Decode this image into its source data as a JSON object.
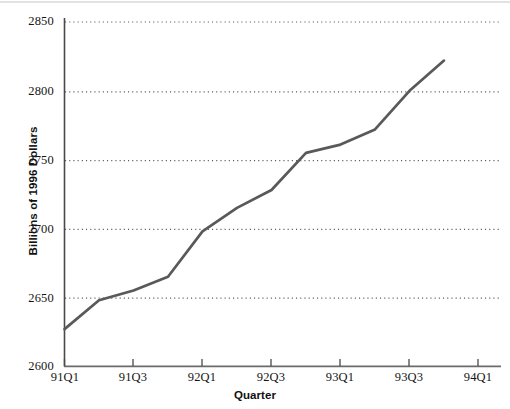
{
  "chart_data": {
    "type": "line",
    "title": "",
    "xlabel": "Quarter",
    "ylabel": "Billions of 1996 Dollars",
    "ylim": [
      2600,
      2850
    ],
    "ytick_labels": [
      "2600",
      "2650",
      "2700",
      "2750",
      "2800",
      "2850"
    ],
    "ytick_values": [
      2600,
      2650,
      2700,
      2750,
      2800,
      2850
    ],
    "xtick_labels": [
      "91Q1",
      "91Q3",
      "92Q1",
      "92Q3",
      "93Q1",
      "93Q3",
      "94Q1"
    ],
    "grid": "horizontal-dotted",
    "legend": "none",
    "line_color": "#595959",
    "categories": [
      "91Q1",
      "91Q2",
      "91Q3",
      "91Q4",
      "92Q1",
      "92Q2",
      "92Q3",
      "92Q4",
      "93Q1",
      "93Q2",
      "93Q3",
      "93Q4"
    ],
    "values": [
      2627,
      2648,
      2655,
      2665,
      2698,
      2715,
      2728,
      2755,
      2761,
      2772,
      2800,
      2822
    ],
    "series": [
      {
        "name": "Real GDP",
        "values": [
          2627,
          2648,
          2655,
          2665,
          2698,
          2715,
          2728,
          2755,
          2761,
          2772,
          2800,
          2822
        ]
      }
    ]
  },
  "axes": {
    "y_label_text": "Billions of 1996 Dollars",
    "x_label_text": "Quarter",
    "y_ticks": [
      {
        "label": "2850"
      },
      {
        "label": "2800"
      },
      {
        "label": "2750"
      },
      {
        "label": "2700"
      },
      {
        "label": "2650"
      },
      {
        "label": "2600"
      }
    ],
    "x_ticks": [
      {
        "label": "91Q1"
      },
      {
        "label": "91Q3"
      },
      {
        "label": "92Q1"
      },
      {
        "label": "92Q3"
      },
      {
        "label": "93Q1"
      },
      {
        "label": "93Q3"
      },
      {
        "label": "94Q1"
      }
    ]
  },
  "colors": {
    "line": "#595959",
    "axis": "#4a4a4a",
    "grid": "#5a5a5a",
    "text": "#151515",
    "top_rule": "#e2e2e2"
  }
}
